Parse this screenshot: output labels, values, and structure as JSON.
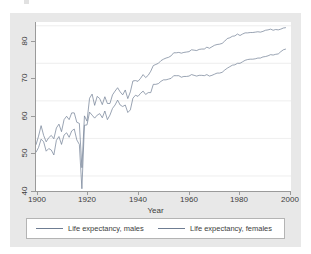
{
  "chart_data": {
    "type": "line",
    "title": "",
    "xlabel": "Year",
    "ylabel": "",
    "xlim": [
      1900,
      2000
    ],
    "ylim": [
      36,
      81
    ],
    "xticks": [
      1900,
      1920,
      1940,
      1960,
      1980,
      2000
    ],
    "yticks": [
      40,
      50,
      60,
      70,
      80
    ],
    "grid": "horizontal",
    "legend_position": "bottom",
    "line_color": "#6f7d92",
    "background_color": "#e8e8e8",
    "plot_background_color": "#ffffff",
    "x": [
      1900,
      1901,
      1902,
      1903,
      1904,
      1905,
      1906,
      1907,
      1908,
      1909,
      1910,
      1911,
      1912,
      1913,
      1914,
      1915,
      1916,
      1917,
      1918,
      1919,
      1920,
      1921,
      1922,
      1923,
      1924,
      1925,
      1926,
      1927,
      1928,
      1929,
      1930,
      1931,
      1932,
      1933,
      1934,
      1935,
      1936,
      1937,
      1938,
      1939,
      1940,
      1941,
      1942,
      1943,
      1944,
      1945,
      1946,
      1947,
      1948,
      1949,
      1950,
      1951,
      1952,
      1953,
      1954,
      1955,
      1956,
      1957,
      1958,
      1959,
      1960,
      1961,
      1962,
      1963,
      1964,
      1965,
      1966,
      1967,
      1968,
      1969,
      1970,
      1971,
      1972,
      1973,
      1974,
      1975,
      1976,
      1977,
      1978,
      1979,
      1980,
      1981,
      1982,
      1983,
      1984,
      1985,
      1986,
      1987,
      1988,
      1989,
      1990,
      1991,
      1992,
      1993,
      1994,
      1995,
      1996,
      1997,
      1998
    ],
    "series": [
      {
        "name": "Life expectancy, males",
        "values": [
          46.3,
          47.6,
          49.8,
          49.1,
          46.6,
          47.3,
          46.9,
          45.6,
          49.5,
          50.5,
          48.4,
          50.9,
          51.5,
          50.3,
          52.0,
          52.5,
          49.6,
          48.4,
          36.6,
          53.5,
          53.6,
          57.0,
          56.2,
          55.4,
          56.2,
          56.6,
          55.5,
          57.3,
          55.0,
          56.2,
          58.0,
          58.9,
          60.2,
          58.9,
          58.5,
          58.9,
          56.9,
          57.6,
          60.7,
          61.5,
          61.2,
          62.0,
          62.6,
          61.7,
          62.2,
          62.2,
          64.4,
          64.4,
          64.6,
          65.2,
          65.6,
          65.6,
          65.8,
          66.0,
          66.7,
          66.7,
          66.7,
          66.3,
          66.5,
          66.5,
          66.6,
          67.0,
          66.8,
          66.6,
          66.8,
          66.8,
          66.7,
          67.0,
          66.6,
          66.8,
          67.1,
          67.4,
          67.4,
          67.6,
          68.2,
          68.7,
          69.1,
          69.5,
          69.6,
          70.0,
          70.0,
          70.4,
          70.8,
          71.0,
          71.1,
          71.1,
          71.2,
          71.4,
          71.4,
          71.7,
          71.8,
          72.0,
          72.3,
          72.2,
          72.4,
          72.5,
          73.1,
          73.6,
          73.8
        ]
      },
      {
        "name": "Life expectancy, females",
        "values": [
          48.3,
          50.6,
          53.4,
          50.8,
          49.1,
          50.2,
          50.8,
          49.9,
          52.8,
          53.8,
          51.8,
          55.0,
          55.9,
          55.0,
          56.8,
          56.8,
          54.3,
          54.0,
          42.2,
          56.0,
          54.6,
          60.7,
          61.8,
          58.8,
          61.2,
          60.6,
          59.0,
          61.1,
          59.3,
          59.3,
          61.6,
          62.6,
          63.5,
          62.4,
          61.6,
          62.9,
          60.6,
          62.4,
          65.3,
          65.4,
          65.2,
          66.0,
          67.0,
          66.2,
          66.8,
          67.9,
          69.4,
          69.7,
          70.0,
          70.7,
          71.1,
          71.4,
          71.6,
          72.0,
          72.8,
          72.8,
          72.9,
          72.7,
          72.9,
          73.0,
          73.1,
          73.6,
          73.5,
          73.4,
          73.7,
          73.8,
          73.8,
          74.3,
          74.0,
          74.4,
          74.8,
          75.0,
          75.1,
          75.3,
          75.9,
          76.6,
          76.8,
          77.2,
          77.3,
          77.8,
          77.4,
          77.8,
          78.1,
          78.1,
          78.2,
          78.2,
          78.3,
          78.4,
          78.3,
          78.5,
          78.8,
          78.9,
          79.1,
          78.8,
          79.0,
          78.9,
          79.1,
          79.4,
          79.5
        ]
      }
    ]
  },
  "axes": {
    "x_title": "Year",
    "x_tick_labels": [
      "1900",
      "1920",
      "1940",
      "1960",
      "1980",
      "2000"
    ],
    "y_tick_labels": [
      "40",
      "50",
      "60",
      "70",
      "80"
    ]
  },
  "legend": {
    "males_label": "Life expectancy, males",
    "females_label": "Life expectancy, females"
  }
}
